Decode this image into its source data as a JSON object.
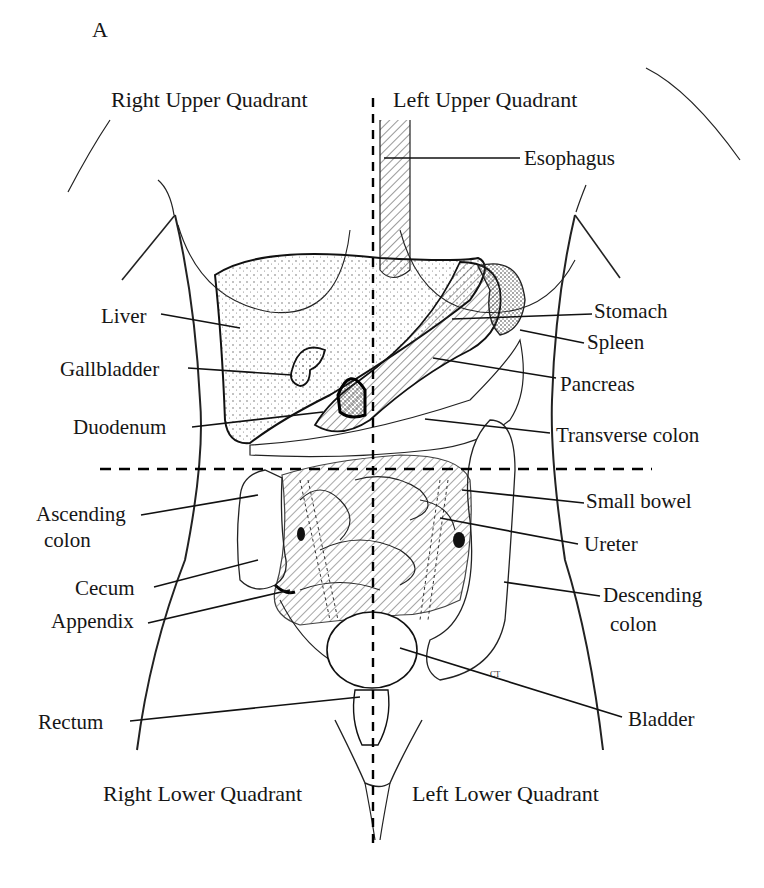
{
  "figure": {
    "panel_letter": "A",
    "quadrants": {
      "right_upper": "Right Upper Quadrant",
      "left_upper": "Left Upper Quadrant",
      "right_lower": "Right Lower Quadrant",
      "left_lower": "Left Lower Quadrant"
    },
    "labels_left": [
      {
        "id": "liver",
        "text": "Liver"
      },
      {
        "id": "gallbladder",
        "text": "Gallbladder"
      },
      {
        "id": "duodenum",
        "text": "Duodenum"
      },
      {
        "id": "ascending_colon",
        "text": "Ascending",
        "text2": "colon"
      },
      {
        "id": "cecum",
        "text": "Cecum"
      },
      {
        "id": "appendix",
        "text": "Appendix"
      },
      {
        "id": "rectum",
        "text": "Rectum"
      }
    ],
    "labels_right": [
      {
        "id": "esophagus",
        "text": "Esophagus"
      },
      {
        "id": "stomach",
        "text": "Stomach"
      },
      {
        "id": "spleen",
        "text": "Spleen"
      },
      {
        "id": "pancreas",
        "text": "Pancreas"
      },
      {
        "id": "transverse_colon",
        "text": "Transverse colon"
      },
      {
        "id": "small_bowel",
        "text": "Small bowel"
      },
      {
        "id": "ureter",
        "text": "Ureter"
      },
      {
        "id": "descending_colon",
        "text": "Descending",
        "text2": "colon"
      },
      {
        "id": "bladder",
        "text": "Bladder"
      }
    ],
    "artist_initials": "CT"
  }
}
